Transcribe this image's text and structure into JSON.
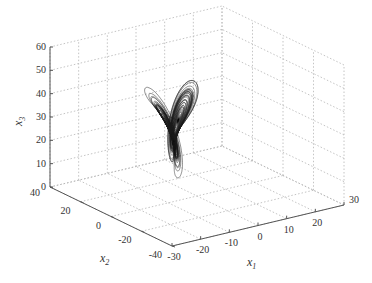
{
  "chart_data": {
    "type": "line",
    "subtype": "3d-trajectory",
    "title": "",
    "xlabel": "x1",
    "ylabel": "x2",
    "zlabel": "x3",
    "xlim": [
      -30,
      30
    ],
    "ylim": [
      -40,
      40
    ],
    "zlim": [
      0,
      60
    ],
    "x_ticks": [
      -30,
      -20,
      -10,
      0,
      10,
      20,
      30
    ],
    "y_ticks": [
      -40,
      -20,
      0,
      20,
      40
    ],
    "z_ticks": [
      0,
      10,
      20,
      30,
      40,
      50,
      60
    ],
    "grid": true,
    "legend": null,
    "series": [
      {
        "name": "trajectory",
        "description": "chaotic attractor trajectory; dense core around x1≈-15..0, x2≈-10..10, x3≈10..30; outer loops reaching x3≈55",
        "color": "#1a1a1a"
      }
    ]
  },
  "axes": {
    "x_label_main": "x",
    "x_label_sub": "1",
    "y_label_main": "x",
    "y_label_sub": "2",
    "z_label_main": "x",
    "z_label_sub": "3"
  }
}
